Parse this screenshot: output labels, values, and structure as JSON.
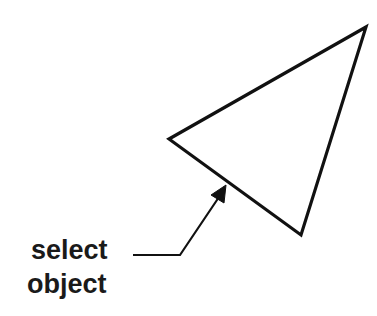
{
  "diagram": {
    "label_line1": "select",
    "label_line2": "object",
    "stroke_color": "#111111",
    "background": "#ffffff",
    "shape": {
      "type": "triangle",
      "vertices": [
        [
          169,
          139
        ],
        [
          366,
          27
        ],
        [
          301,
          235
        ]
      ]
    },
    "leader": {
      "points": [
        [
          133,
          255
        ],
        [
          180,
          255
        ],
        [
          220,
          196
        ]
      ],
      "arrow_tip": [
        226,
        185
      ]
    }
  }
}
